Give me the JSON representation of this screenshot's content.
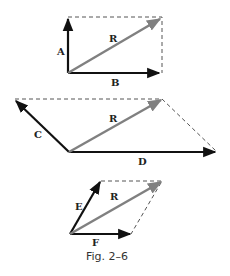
{
  "figure": {
    "caption": "Fig. 2–6",
    "colors": {
      "vector": "#111111",
      "resultant": "#808080",
      "dashed": "#555555"
    },
    "diagrams": [
      {
        "name": "rectangle",
        "vectors": [
          {
            "label": "A",
            "from": [
              68,
              73
            ],
            "to": [
              68,
              18
            ]
          },
          {
            "label": "B",
            "from": [
              68,
              73
            ],
            "to": [
              160,
              73
            ]
          }
        ],
        "resultant": {
          "label": "R",
          "from": [
            68,
            73
          ],
          "to": [
            161,
            18
          ]
        }
      },
      {
        "name": "wide-parallelogram",
        "vectors": [
          {
            "label": "C",
            "from": [
              69,
              152
            ],
            "to": [
              15,
              100
            ]
          },
          {
            "label": "D",
            "from": [
              69,
              152
            ],
            "to": [
              216,
              152
            ]
          }
        ],
        "resultant": {
          "label": "R",
          "from": [
            69,
            152
          ],
          "to": [
            162,
            99
          ]
        }
      },
      {
        "name": "small-parallelogram",
        "vectors": [
          {
            "label": "E",
            "from": [
              70,
              234
            ],
            "to": [
              101,
              181
            ]
          },
          {
            "label": "F",
            "from": [
              70,
              234
            ],
            "to": [
              131,
              234
            ]
          }
        ],
        "resultant": {
          "label": "R",
          "from": [
            70,
            234
          ],
          "to": [
            162,
            181
          ]
        }
      }
    ]
  }
}
